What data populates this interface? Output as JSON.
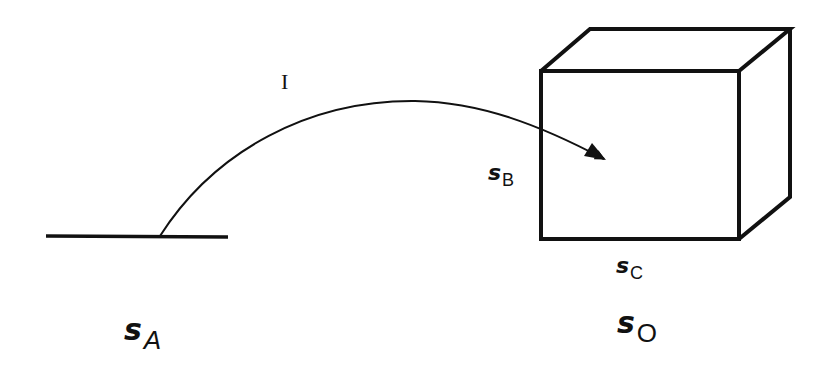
{
  "diagram": {
    "type": "illustration",
    "colors": {
      "stroke": "#111111",
      "background": "#ffffff"
    },
    "path_label": "I",
    "labels": {
      "sA": {
        "symbol": "s",
        "subscript": "A"
      },
      "sB": {
        "symbol": "s",
        "subscript": "B"
      },
      "sC": {
        "symbol": "s",
        "subscript": "C"
      },
      "sO": {
        "symbol": "s",
        "subscript": "O"
      }
    }
  }
}
